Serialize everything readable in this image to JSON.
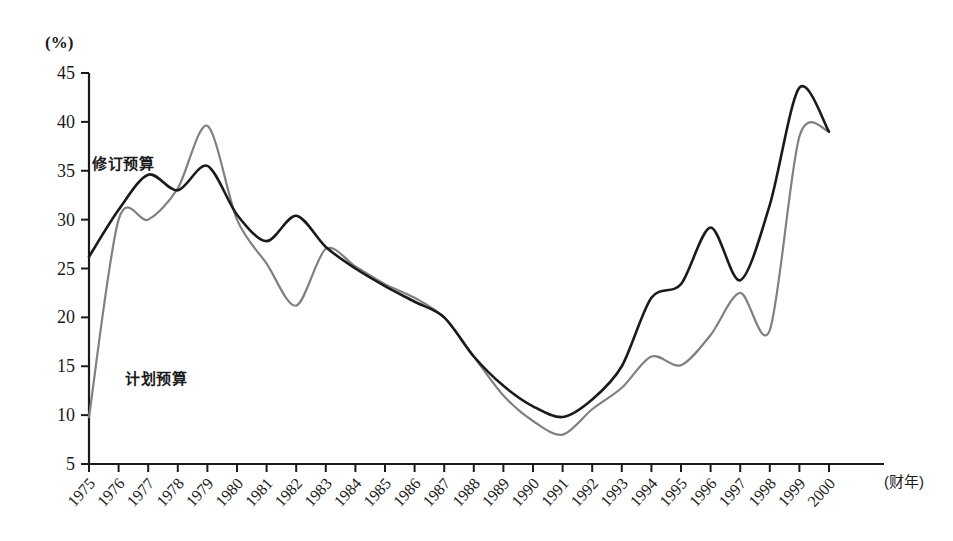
{
  "chart_data": {
    "type": "line",
    "title": "",
    "subtitle": "",
    "xlabel": "(财年)",
    "ylabel": "(%)",
    "unit_label": "(%)",
    "xaxis_caption": "(财年)",
    "ylim": [
      5,
      45
    ],
    "ytick_values": [
      5,
      10,
      15,
      20,
      25,
      30,
      35,
      40,
      45
    ],
    "ytick_labels": [
      "5",
      "10",
      "15",
      "20",
      "25",
      "30",
      "35",
      "40",
      "45"
    ],
    "grid": false,
    "legend_position": "inline-annotations",
    "categories": [
      "1975",
      "1976",
      "1977",
      "1978",
      "1979",
      "1980",
      "1981",
      "1982",
      "1983",
      "1984",
      "1985",
      "1986",
      "1987",
      "1988",
      "1989",
      "1990",
      "1991",
      "1992",
      "1993",
      "1994",
      "1995",
      "1996",
      "1997",
      "1998",
      "1999",
      "2000"
    ],
    "series": [
      {
        "name": "修订预算",
        "color": "#1a1a1a",
        "label_text": "修订预算",
        "values": [
          26.2,
          31.0,
          34.6,
          33.0,
          35.5,
          30.5,
          27.8,
          30.4,
          27.2,
          25.0,
          23.2,
          21.6,
          20.0,
          16.0,
          13.0,
          10.9,
          9.8,
          11.6,
          15.0,
          22.0,
          23.4,
          29.2,
          23.8,
          31.5,
          43.5,
          39.0
        ]
      },
      {
        "name": "计划预算",
        "color": "#808080",
        "label_text": "计划预算",
        "values": [
          9.8,
          30.0,
          30.0,
          33.2,
          39.6,
          30.0,
          25.5,
          21.2,
          27.0,
          25.2,
          23.4,
          22.0,
          20.0,
          16.0,
          12.0,
          9.4,
          8.0,
          10.6,
          12.8,
          16.0,
          15.1,
          18.2,
          22.5,
          18.7,
          38.5,
          39.0
        ]
      }
    ],
    "annotations": [
      {
        "text": "修订预算",
        "series": "修订预算",
        "x_px": 92,
        "y_px": 152
      },
      {
        "text": "计划预算",
        "series": "计划预算",
        "x_px": 125,
        "y_px": 367
      }
    ]
  }
}
